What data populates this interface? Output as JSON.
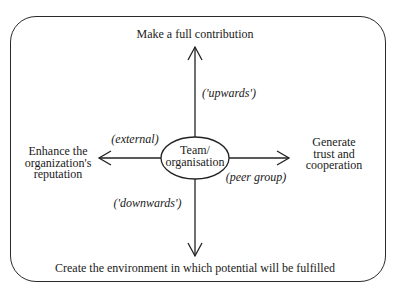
{
  "diagram": {
    "center": {
      "line1": "Team/",
      "line2": "organisation"
    },
    "top": {
      "text": "Make a full contribution",
      "direction_label": "('upwards')"
    },
    "bottom": {
      "text": "Create the environment in which potential will be fulfilled",
      "direction_label": "('downwards')"
    },
    "left": {
      "line1": "Enhance the",
      "line2": "organization's",
      "line3": "reputation",
      "direction_label": "(external)"
    },
    "right": {
      "line1": "Generate",
      "line2": "trust and",
      "line3": "cooperation",
      "direction_label": "(peer group)"
    }
  }
}
